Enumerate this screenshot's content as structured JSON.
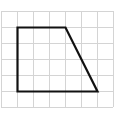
{
  "diagram": {
    "type": "grid-shape",
    "grid": {
      "origin_x": 1,
      "origin_y": 11,
      "cell_size": 16,
      "columns": 7,
      "rows": 6,
      "line_color": "#d4d4d4"
    },
    "shape": {
      "name": "trapezoid",
      "stroke_color": "#111111",
      "stroke_width": 2.2,
      "vertices_grid": [
        [
          1,
          1
        ],
        [
          4,
          1
        ],
        [
          6,
          5
        ],
        [
          1,
          5
        ]
      ]
    }
  }
}
